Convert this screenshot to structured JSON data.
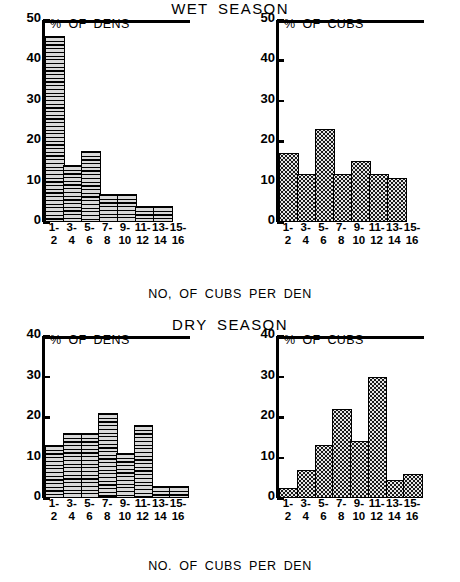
{
  "figure": {
    "panels": [
      {
        "season_title": "WET  SEASON",
        "xaxis_caption": "NO, OF CUBS PER DEN",
        "charts": [
          {
            "plot_label": "% OF DENS",
            "yticks": [
              "0",
              "10",
              "20",
              "30",
              "40",
              "50"
            ],
            "xticks_top": [
              "1-",
              "3-",
              "5-",
              "7-",
              "9-",
              "11-",
              "13-",
              "15-"
            ],
            "xticks_bottom": [
              "2",
              "4",
              "6",
              "8",
              "10",
              "12",
              "14",
              "16"
            ]
          },
          {
            "plot_label": "% OF CUBS",
            "yticks": [
              "0",
              "10",
              "20",
              "30",
              "40",
              "50"
            ],
            "xticks_top": [
              "1-",
              "3-",
              "5-",
              "7-",
              "9-",
              "11-",
              "13-",
              "15-"
            ],
            "xticks_bottom": [
              "2",
              "4",
              "6",
              "8",
              "10",
              "12",
              "14",
              "16"
            ]
          }
        ]
      },
      {
        "season_title": "DRY  SEASON",
        "xaxis_caption": "NO. OF CUBS PER DEN",
        "charts": [
          {
            "plot_label": "% OF DENS",
            "yticks": [
              "0",
              "10",
              "20",
              "30",
              "40"
            ],
            "xticks_top": [
              "1-",
              "3-",
              "5-",
              "7-",
              "9-",
              "11-",
              "13-",
              "15-"
            ],
            "xticks_bottom": [
              "2",
              "4",
              "6",
              "8",
              "10",
              "12",
              "14",
              "16"
            ]
          },
          {
            "plot_label": "% OF CUBS",
            "yticks": [
              "0",
              "10",
              "20",
              "30",
              "40"
            ],
            "xticks_top": [
              "1-",
              "3-",
              "5-",
              "7-",
              "9-",
              "11-",
              "13-",
              "15-"
            ],
            "xticks_bottom": [
              "2",
              "4",
              "6",
              "8",
              "10",
              "12",
              "14",
              "16"
            ]
          }
        ]
      }
    ]
  },
  "chart_data": [
    {
      "type": "bar",
      "title": "WET SEASON",
      "subtitle": "% OF DENS",
      "xlabel": "NO, OF CUBS PER DEN",
      "ylabel": "% OF DENS",
      "categories": [
        "1-2",
        "3-4",
        "5-6",
        "7-8",
        "9-10",
        "11-12",
        "13-14",
        "15-16"
      ],
      "values": [
        46,
        14,
        17.5,
        7,
        7,
        4,
        4,
        0
      ],
      "ylim": [
        0,
        50
      ],
      "ytick_step": 10,
      "grid": false,
      "legend": "none",
      "fill_pattern": "horizontal-lines"
    },
    {
      "type": "bar",
      "title": "WET SEASON",
      "subtitle": "% OF CUBS",
      "xlabel": "NO, OF CUBS PER DEN",
      "ylabel": "% OF CUBS",
      "categories": [
        "1-2",
        "3-4",
        "5-6",
        "7-8",
        "9-10",
        "11-12",
        "13-14",
        "15-16"
      ],
      "values": [
        17,
        12,
        23,
        12,
        15,
        12,
        11,
        0
      ],
      "ylim": [
        0,
        50
      ],
      "ytick_step": 10,
      "grid": false,
      "legend": "none",
      "fill_pattern": "stipple-dots"
    },
    {
      "type": "bar",
      "title": "DRY SEASON",
      "subtitle": "% OF DENS",
      "xlabel": "NO. OF CUBS PER DEN",
      "ylabel": "% OF DENS",
      "categories": [
        "1-2",
        "3-4",
        "5-6",
        "7-8",
        "9-10",
        "11-12",
        "13-14",
        "15-16"
      ],
      "values": [
        13,
        16,
        16,
        21,
        11,
        18,
        3,
        3
      ],
      "ylim": [
        0,
        40
      ],
      "ytick_step": 10,
      "grid": false,
      "legend": "none",
      "fill_pattern": "horizontal-lines"
    },
    {
      "type": "bar",
      "title": "DRY SEASON",
      "subtitle": "% OF CUBS",
      "xlabel": "NO. OF CUBS PER DEN",
      "ylabel": "% OF CUBS",
      "categories": [
        "1-2",
        "3-4",
        "5-6",
        "7-8",
        "9-10",
        "11-12",
        "13-14",
        "15-16"
      ],
      "values": [
        2.5,
        7,
        13,
        22,
        14,
        30,
        4.5,
        6
      ],
      "ylim": [
        0,
        40
      ],
      "ytick_step": 10,
      "grid": false,
      "legend": "none",
      "fill_pattern": "stipple-dots"
    }
  ],
  "colors": {
    "ink": "#000000",
    "background": "#ffffff",
    "fill_light": "#d9d9d9"
  }
}
